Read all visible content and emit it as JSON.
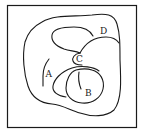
{
  "figure": {
    "stroke_color": "#1a1a1a",
    "background": "#ffffff",
    "labels": {
      "A": "A",
      "B": "B",
      "C": "C",
      "D": "D"
    }
  }
}
